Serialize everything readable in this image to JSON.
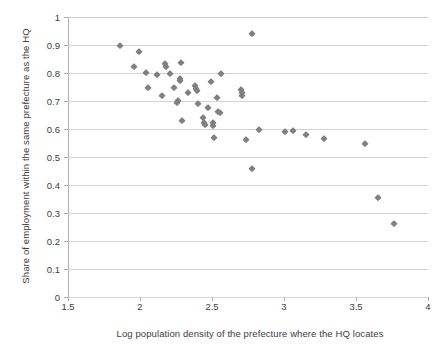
{
  "chart_data": {
    "type": "scatter",
    "title": "",
    "xlabel": "Log population density of the prefecture where the HQ locates",
    "ylabel": "Share of employment within the same prefecture as the HQ",
    "xlim": [
      1.5,
      4
    ],
    "ylim": [
      0,
      1
    ],
    "xticks": [
      "1.5",
      "2",
      "2.5",
      "3",
      "3.5",
      "4"
    ],
    "xtick_values": [
      1.5,
      2,
      2.5,
      3,
      3.5,
      4
    ],
    "yticks": [
      "0",
      "0.1",
      "0.2",
      "0.3",
      "0.4",
      "0.5",
      "0.6",
      "0.7",
      "0.8",
      "0.9",
      "1"
    ],
    "ytick_values": [
      0,
      0.1,
      0.2,
      0.3,
      0.4,
      0.5,
      0.6,
      0.7,
      0.8,
      0.9,
      1
    ],
    "grid": "horizontal",
    "legend": "none",
    "marker_shape": "diamond",
    "marker_color": "#808080",
    "points": [
      {
        "x": 1.86,
        "y": 0.898
      },
      {
        "x": 1.955,
        "y": 0.82
      },
      {
        "x": 1.99,
        "y": 0.876
      },
      {
        "x": 2.045,
        "y": 0.801
      },
      {
        "x": 2.055,
        "y": 0.746
      },
      {
        "x": 2.115,
        "y": 0.794
      },
      {
        "x": 2.155,
        "y": 0.719
      },
      {
        "x": 2.175,
        "y": 0.833
      },
      {
        "x": 2.178,
        "y": 0.823
      },
      {
        "x": 2.21,
        "y": 0.797
      },
      {
        "x": 2.235,
        "y": 0.747
      },
      {
        "x": 2.26,
        "y": 0.694
      },
      {
        "x": 2.262,
        "y": 0.7
      },
      {
        "x": 2.275,
        "y": 0.78
      },
      {
        "x": 2.278,
        "y": 0.772
      },
      {
        "x": 2.285,
        "y": 0.835
      },
      {
        "x": 2.29,
        "y": 0.627
      },
      {
        "x": 2.33,
        "y": 0.727
      },
      {
        "x": 2.385,
        "y": 0.752
      },
      {
        "x": 2.39,
        "y": 0.744
      },
      {
        "x": 2.395,
        "y": 0.737
      },
      {
        "x": 2.405,
        "y": 0.69
      },
      {
        "x": 2.44,
        "y": 0.64
      },
      {
        "x": 2.445,
        "y": 0.622
      },
      {
        "x": 2.448,
        "y": 0.613
      },
      {
        "x": 2.47,
        "y": 0.675
      },
      {
        "x": 2.49,
        "y": 0.767
      },
      {
        "x": 2.505,
        "y": 0.62
      },
      {
        "x": 2.508,
        "y": 0.611
      },
      {
        "x": 2.515,
        "y": 0.568
      },
      {
        "x": 2.535,
        "y": 0.71
      },
      {
        "x": 2.545,
        "y": 0.66
      },
      {
        "x": 2.555,
        "y": 0.657
      },
      {
        "x": 2.56,
        "y": 0.795
      },
      {
        "x": 2.7,
        "y": 0.741
      },
      {
        "x": 2.705,
        "y": 0.727
      },
      {
        "x": 2.707,
        "y": 0.717
      },
      {
        "x": 2.735,
        "y": 0.559
      },
      {
        "x": 2.775,
        "y": 0.941
      },
      {
        "x": 2.775,
        "y": 0.457
      },
      {
        "x": 2.825,
        "y": 0.598
      },
      {
        "x": 3.01,
        "y": 0.588
      },
      {
        "x": 3.065,
        "y": 0.592
      },
      {
        "x": 3.155,
        "y": 0.579
      },
      {
        "x": 3.275,
        "y": 0.563
      },
      {
        "x": 3.565,
        "y": 0.547
      },
      {
        "x": 3.655,
        "y": 0.353
      },
      {
        "x": 3.765,
        "y": 0.26
      }
    ]
  }
}
